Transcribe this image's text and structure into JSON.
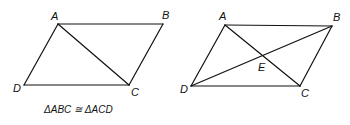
{
  "figures": [
    {
      "name": "parallelogram-with-diagonal-ac",
      "vertices": {
        "A": [
          58,
          24
        ],
        "B": [
          163,
          24
        ],
        "C": [
          129,
          85
        ],
        "D": [
          24,
          85
        ]
      },
      "labels": {
        "A": "A",
        "B": "B",
        "C": "C",
        "D": "D"
      },
      "caption": "ΔABC ≅ ΔACD"
    },
    {
      "name": "parallelogram-with-both-diagonals",
      "vertices": {
        "A": [
          225,
          25
        ],
        "B": [
          332,
          26
        ],
        "C": [
          300,
          86
        ],
        "D": [
          191,
          86
        ],
        "E": [
          262,
          56
        ]
      },
      "labels": {
        "A": "A",
        "B": "B",
        "C": "C",
        "D": "D",
        "E": "E"
      }
    }
  ],
  "colors": {
    "stroke": "#111111",
    "background": "#ffffff"
  }
}
